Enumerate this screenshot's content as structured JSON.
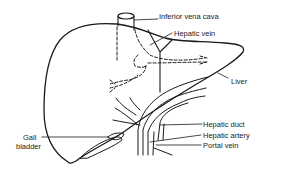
{
  "diagram": {
    "stroke_color": "#1a1a1a",
    "background": "#ffffff",
    "labels": [
      {
        "id": "ivc",
        "text": "Inferior vena cava"
      },
      {
        "id": "hepatic-vein",
        "text": "Hepatic vein"
      },
      {
        "id": "liver",
        "text": "Liver"
      },
      {
        "id": "hepatic-duct",
        "text": "Hepatic duct"
      },
      {
        "id": "hepatic-artery",
        "text": "Hepatic artery"
      },
      {
        "id": "portal-vein",
        "text": "Portal vein"
      },
      {
        "id": "gall",
        "text": "Gall"
      },
      {
        "id": "bladder",
        "text": "bladder"
      }
    ]
  }
}
